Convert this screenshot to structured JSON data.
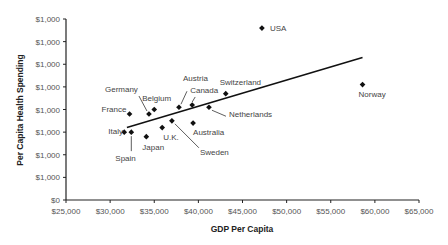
{
  "chart_data": {
    "type": "scatter",
    "title": "",
    "xlabel": "GDP Per Capita",
    "ylabel": "Per Capita Health Spending",
    "xlim": [
      25000,
      65000
    ],
    "x_ticks": [
      "$25,000",
      "$30,000",
      "$35,000",
      "$40,000",
      "$45,000",
      "$50,000",
      "$55,000",
      "$60,000",
      "$65,000"
    ],
    "y_ticks": [
      "$0",
      "$1,000",
      "$1,000",
      "$1,000",
      "$1,000",
      "$1,000",
      "$1,000",
      "$1,000",
      "$1,000"
    ],
    "y_ticks_note": "y tick labels rendered as $1,000 for every nonzero gridline; y values below are in tick-interval units (0-8)",
    "ylim_ticks": [
      0,
      8
    ],
    "grid": false,
    "legend": null,
    "trendline": {
      "x": [
        31900,
        58600
      ],
      "y": [
        3.2,
        6.3
      ]
    },
    "points": [
      {
        "label": "USA",
        "x": 47200,
        "y": 7.6
      },
      {
        "label": "Norway",
        "x": 58600,
        "y": 5.1
      },
      {
        "label": "Switzerland",
        "x": 43100,
        "y": 4.7
      },
      {
        "label": "Netherlands",
        "x": 41200,
        "y": 4.1
      },
      {
        "label": "Canada",
        "x": 39300,
        "y": 4.2
      },
      {
        "label": "Austria",
        "x": 37800,
        "y": 4.1
      },
      {
        "label": "Belgium",
        "x": 35000,
        "y": 4.0
      },
      {
        "label": "Germany",
        "x": 34400,
        "y": 3.8
      },
      {
        "label": "France",
        "x": 32200,
        "y": 3.8
      },
      {
        "label": "Australia",
        "x": 39400,
        "y": 3.4
      },
      {
        "label": "Sweden",
        "x": 37000,
        "y": 3.5
      },
      {
        "label": "U.K.",
        "x": 35900,
        "y": 3.2
      },
      {
        "label": "Japan",
        "x": 34100,
        "y": 2.8
      },
      {
        "label": "Spain",
        "x": 32400,
        "y": 3.0
      },
      {
        "label": "Italy",
        "x": 31600,
        "y": 3.0
      }
    ]
  }
}
